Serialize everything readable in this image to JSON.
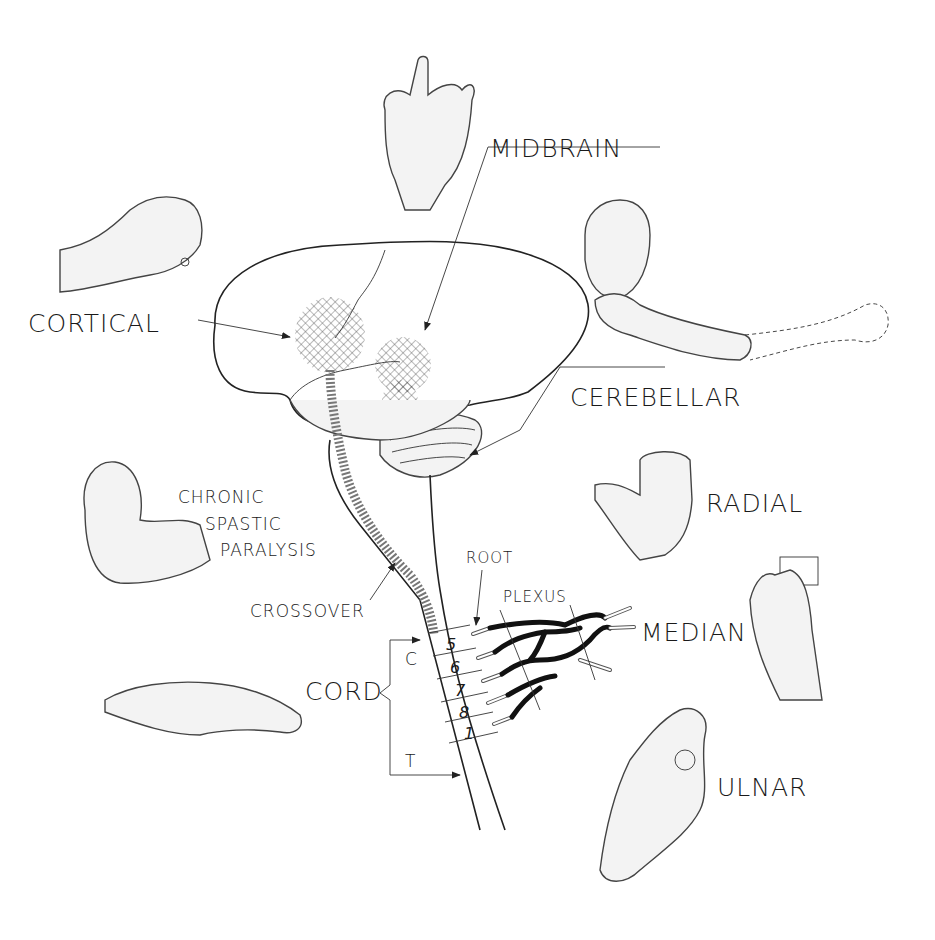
{
  "diagram": {
    "labels": {
      "midbrain": "MIDBRAIN",
      "cortical": "CORTICAL",
      "cerebellar": "CEREBELLAR",
      "radial": "RADIAL",
      "median": "MEDIAN",
      "ulnar": "ULNAR",
      "chronic_line1": "CHRONIC",
      "chronic_line2": "SPASTIC",
      "chronic_line3": "PARALYSIS",
      "crossover": "CROSSOVER",
      "root": "ROOT",
      "plexus": "PLEXUS",
      "cord": "CORD",
      "cervical": "C",
      "thoracic": "T"
    },
    "cord_segments": [
      "5",
      "6",
      "7",
      "8",
      "1"
    ],
    "colors": {
      "ink": "#222222",
      "background": "#ffffff",
      "shading": "#f3f3f3"
    }
  }
}
